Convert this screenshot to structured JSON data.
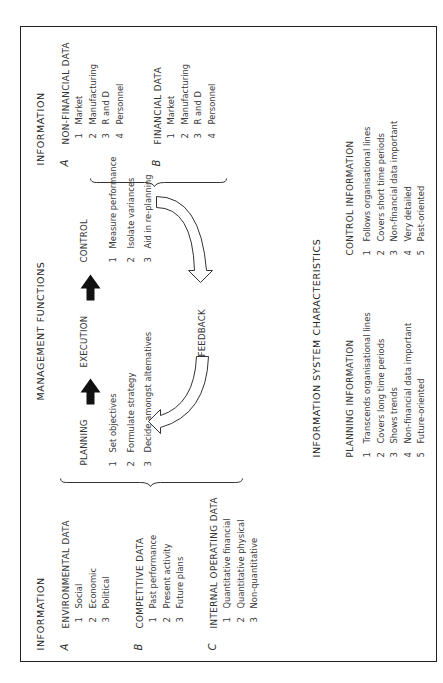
{
  "diagram": {
    "orientation": "rotated 90 degrees counterclockwise",
    "management_functions": {
      "title": "MANAGEMENT FUNCTIONS",
      "stages": [
        "PLANNING",
        "EXECUTION",
        "CONTROL"
      ],
      "planning_steps": [
        {
          "num": "1",
          "label": "Set objectives"
        },
        {
          "num": "2",
          "label": "Formulate strategy"
        },
        {
          "num": "3",
          "label": "Decide amongst alternatives"
        }
      ],
      "control_steps": [
        {
          "num": "1",
          "label": "Measure performance"
        },
        {
          "num": "2",
          "label": "Isolate variances"
        },
        {
          "num": "3",
          "label": "Aid in re-planning"
        }
      ],
      "feedback_label": "FEEDBACK"
    },
    "left_information": {
      "title": "INFORMATION",
      "sections": [
        {
          "letter": "A",
          "title": "ENVIRONMENTAL DATA",
          "items": [
            {
              "num": "1",
              "label": "Social"
            },
            {
              "num": "2",
              "label": "Economic"
            },
            {
              "num": "3",
              "label": "Political"
            }
          ]
        },
        {
          "letter": "B",
          "title": "COMPETITIVE DATA",
          "items": [
            {
              "num": "1",
              "label": "Past performance"
            },
            {
              "num": "2",
              "label": "Present activity"
            },
            {
              "num": "3",
              "label": "Future plans"
            }
          ]
        },
        {
          "letter": "C",
          "title": "INTERNAL OPERATING DATA",
          "items": [
            {
              "num": "1",
              "label": "Quantitative financial"
            },
            {
              "num": "2",
              "label": "Quantitative physical"
            },
            {
              "num": "3",
              "label": "Non-quantitative"
            }
          ]
        }
      ]
    },
    "right_information": {
      "title": "INFORMATION",
      "sections": [
        {
          "letter": "A",
          "title": "NON-FINANCIAL DATA",
          "items": [
            {
              "num": "1",
              "label": "Market"
            },
            {
              "num": "2",
              "label": "Manufacturing"
            },
            {
              "num": "3",
              "label": "R and D"
            },
            {
              "num": "4",
              "label": "Personnel"
            }
          ]
        },
        {
          "letter": "B",
          "title": "FINANCIAL DATA",
          "items": [
            {
              "num": "1",
              "label": "Market"
            },
            {
              "num": "2",
              "label": "Manufacturing"
            },
            {
              "num": "3",
              "label": "R and D"
            },
            {
              "num": "4",
              "label": "Personnel"
            }
          ]
        }
      ]
    },
    "characteristics": {
      "title": "INFORMATION SYSTEM CHARACTERISTICS",
      "planning": {
        "title": "PLANNING INFORMATION",
        "items": [
          {
            "num": "1",
            "label": "Transcends organisational lines"
          },
          {
            "num": "2",
            "label": "Covers long time periods"
          },
          {
            "num": "3",
            "label": "Shows trends"
          },
          {
            "num": "4",
            "label": "Non-financial data important"
          },
          {
            "num": "5",
            "label": "Future-oriented"
          }
        ]
      },
      "control": {
        "title": "CONTROL INFORMATION",
        "items": [
          {
            "num": "1",
            "label": "Follows organisational lines"
          },
          {
            "num": "2",
            "label": "Covers short time periods"
          },
          {
            "num": "3",
            "label": "Non-financial data important"
          },
          {
            "num": "4",
            "label": "Very detailed"
          },
          {
            "num": "5",
            "label": "Past-oriented"
          }
        ]
      }
    }
  }
}
